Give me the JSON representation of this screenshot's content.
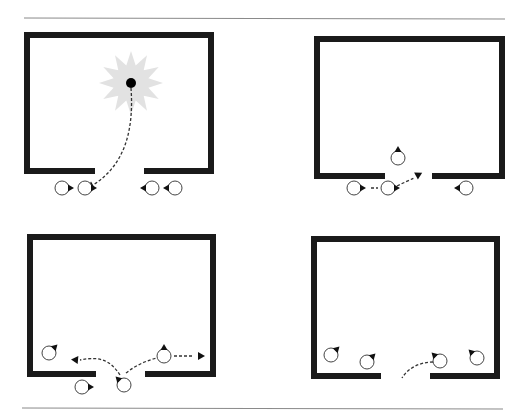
{
  "figure": {
    "title": "",
    "colors": {
      "wall": "#1a1a1a",
      "rule": "#8a8a8a",
      "starburst": "#e2e2e2",
      "path": "#333333",
      "agent_fill": "#ffffff",
      "agent_stroke": "#444444",
      "heading": "#111111"
    },
    "rules": [
      {
        "name": "top-rule",
        "x1": 24,
        "y1": 18,
        "x2": 505,
        "y2": 19
      },
      {
        "name": "bottom-rule",
        "x1": 22,
        "y1": 408,
        "x2": 503,
        "y2": 409
      }
    ],
    "panels": [
      {
        "name": "panel-top-left",
        "room": {
          "left": 24,
          "top": 32,
          "right": 214,
          "bottom": 174,
          "door_left": 95,
          "door_right": 144
        },
        "starburst": {
          "cx": 131,
          "cy": 83,
          "r_outer": 32,
          "r_inner": 18,
          "points": 12
        },
        "target_dot": {
          "cx": 131,
          "cy": 83,
          "r": 5
        },
        "agents": [
          {
            "cx": 62,
            "cy": 188,
            "heading": "right"
          },
          {
            "cx": 85,
            "cy": 188,
            "heading": "right"
          },
          {
            "cx": 152,
            "cy": 188,
            "heading": "left"
          },
          {
            "cx": 175,
            "cy": 188,
            "heading": "left"
          }
        ],
        "paths": [
          {
            "d": "M131,88 C134,130 125,165 93,185",
            "arrow": {
              "x": 93,
              "y": 185,
              "angle": 150
            }
          }
        ]
      },
      {
        "name": "panel-top-right",
        "room": {
          "left": 314,
          "top": 36,
          "right": 505,
          "bottom": 179,
          "door_left": 385,
          "door_right": 432
        },
        "agents": [
          {
            "cx": 398,
            "cy": 158,
            "heading": "up"
          },
          {
            "cx": 354,
            "cy": 188,
            "heading": "right"
          },
          {
            "cx": 388,
            "cy": 188,
            "heading": "right"
          },
          {
            "cx": 466,
            "cy": 188,
            "heading": "left"
          }
        ],
        "paths": [
          {
            "d": "M371,188 L378,188",
            "arrow": null
          },
          {
            "d": "M397,186 C405,182 410,180 414,178",
            "arrow": {
              "x": 416,
              "y": 176,
              "angle": -28
            }
          }
        ]
      },
      {
        "name": "panel-bottom-left",
        "room": {
          "left": 27,
          "top": 234,
          "right": 216,
          "bottom": 377,
          "door_left": 96,
          "door_right": 145
        },
        "agents": [
          {
            "cx": 49,
            "cy": 353,
            "heading": "up-right"
          },
          {
            "cx": 164,
            "cy": 356,
            "heading": "up"
          },
          {
            "cx": 82,
            "cy": 387,
            "heading": "right"
          },
          {
            "cx": 124,
            "cy": 385,
            "heading": "up-left"
          }
        ],
        "paths": [
          {
            "d": "M120,375 C110,360 100,356 80,360",
            "arrow": {
              "x": 78,
              "y": 360,
              "angle": 185
            }
          },
          {
            "d": "M126,373 C136,365 148,360 157,358",
            "arrow": null
          },
          {
            "d": "M174,356 L194,356",
            "arrow": {
              "x": 198,
              "y": 356,
              "angle": 0
            }
          }
        ]
      },
      {
        "name": "panel-bottom-right",
        "room": {
          "left": 311,
          "top": 236,
          "right": 500,
          "bottom": 379,
          "door_left": 381,
          "door_right": 430
        },
        "agents": [
          {
            "cx": 331,
            "cy": 355,
            "heading": "up-right"
          },
          {
            "cx": 367,
            "cy": 362,
            "heading": "up-right"
          },
          {
            "cx": 440,
            "cy": 361,
            "heading": "up-left"
          },
          {
            "cx": 477,
            "cy": 358,
            "heading": "up-left"
          }
        ],
        "paths": [
          {
            "d": "M433,362 C420,362 408,368 402,378",
            "arrow": null
          }
        ]
      }
    ]
  }
}
